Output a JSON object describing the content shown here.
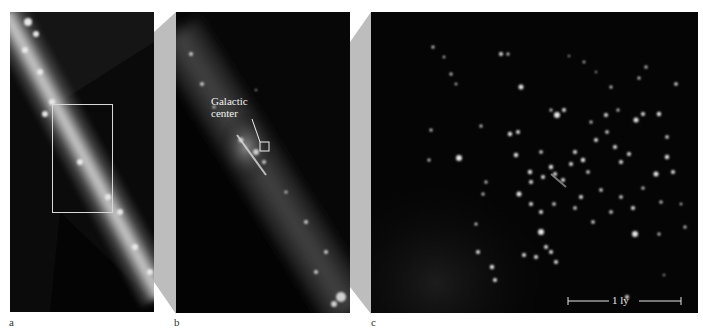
{
  "figure": {
    "panels": [
      {
        "id": "a",
        "label": "a",
        "description": "Wide-field view of the Milky Way band with selection rectangle"
      },
      {
        "id": "b",
        "label": "b",
        "description": "Zoomed view around the galactic center",
        "annotation": {
          "line1": "Galactic",
          "line2": "center"
        }
      },
      {
        "id": "c",
        "label": "c",
        "description": "Star cluster at the galactic center",
        "scale_bar": {
          "label": "1 ly"
        }
      }
    ],
    "colors": {
      "background": "#ffffff",
      "panel_bg": "#050505",
      "connector": "#bdbdbd",
      "annotation_text": "#f2f2f2",
      "label_text": "#333333"
    }
  }
}
